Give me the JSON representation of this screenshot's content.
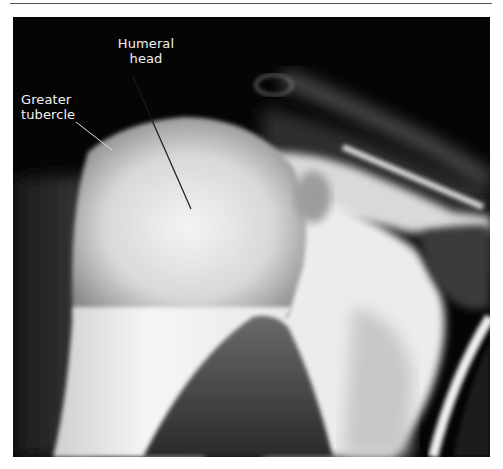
{
  "figure": {
    "type": "radiograph",
    "labels": {
      "humeral_head": {
        "line1": "Humeral",
        "line2": "head"
      },
      "greater_tubercle": {
        "line1": "Greater",
        "line2": "tubercle"
      }
    }
  }
}
